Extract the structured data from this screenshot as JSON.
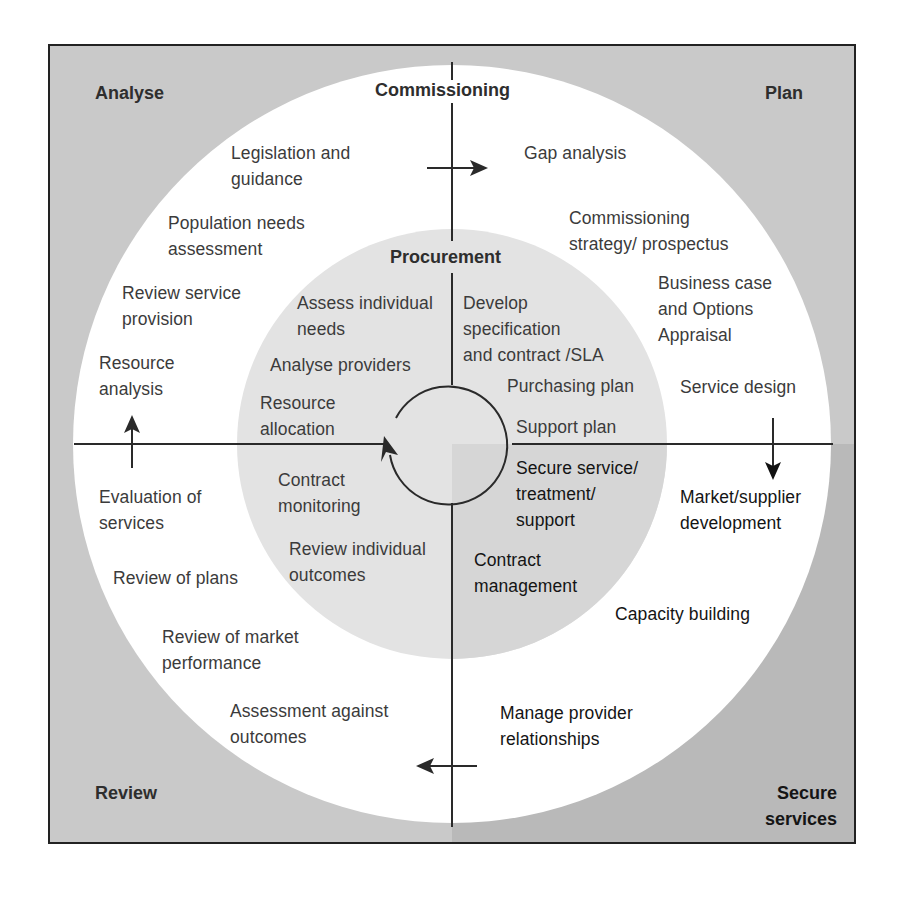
{
  "colors": {
    "outer_gray": "#c9c9c9",
    "outer_gray_dark": "#b9b9b9",
    "ring_white": "#ffffff",
    "inner_gray": "#e3e3e3",
    "inner_gray_dark": "#d5d5d5",
    "line": "#2a2a2a"
  },
  "diagram": {
    "quadrants": {
      "analyse": "Analyse",
      "plan": "Plan",
      "review": "Review",
      "secure_services": "Secure\nservices"
    },
    "outer_title": "Commissioning",
    "inner_title": "Procurement",
    "outer_ring": {
      "analyse": [
        "Legislation and\nguidance",
        "Population needs\nassessment",
        "Review service\nprovision",
        "Resource\nanalysis"
      ],
      "plan": [
        "Gap analysis",
        "Commissioning\nstrategy/ prospectus",
        "Business case\nand Options\nAppraisal",
        "Service design"
      ],
      "secure": [
        "Market/supplier\ndevelopment",
        "Capacity building",
        "Manage provider\nrelationships"
      ],
      "review": [
        "Evaluation of\nservices",
        "Review of plans",
        "Review of market\nperformance",
        "Assessment against\noutcomes"
      ]
    },
    "inner_circle": {
      "top_left": [
        "Assess individual\nneeds",
        "Analyse providers",
        "Resource\nallocation"
      ],
      "top_right": [
        "Develop\nspecification\nand contract /SLA",
        "Purchasing plan",
        "Support plan"
      ],
      "bottom_right": [
        "Secure service/\ntreatment/\nsupport",
        "Contract\nmanagement"
      ],
      "bottom_left": [
        "Contract\nmonitoring",
        "Review individual\noutcomes"
      ]
    }
  }
}
